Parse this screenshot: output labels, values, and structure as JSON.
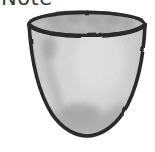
{
  "page": {
    "background_color": "#ffffff",
    "width": 155,
    "height": 152
  },
  "caption": {
    "text": "Note",
    "visible_fragment": "ote",
    "color": "#3b3b3b",
    "note": "word is cropped by the top edge of the image; only the lower portion of the glyphs is visible"
  },
  "illustration": {
    "name": "bowl-sketch",
    "subject": "bowl",
    "style": "hand-drawn pencil sketch, grayscale, scanned",
    "alt_text": "A hand-drawn grayscale sketch of an open bowl with a wide elliptical rim, tapering sides and a rounded bottom",
    "colors": {
      "outline": "#2b2b2b",
      "body_fill": "#cfcfcf",
      "body_fill_light": "#dcdcdc",
      "rim_interior": "#b4b4b4",
      "rim_mottle": "#8e8e8e",
      "shading_left": "#a5a5a5",
      "shading_bottom": "#9b9b9b",
      "background": "#ffffff"
    },
    "geometry": {
      "rim_center_x": 87,
      "rim_center_y": 24,
      "rim_radius_x": 59,
      "rim_radius_y": 12,
      "left_edge_top_x": 28,
      "right_edge_top_x": 146,
      "bottom_y": 136,
      "bottom_width": 78
    }
  }
}
